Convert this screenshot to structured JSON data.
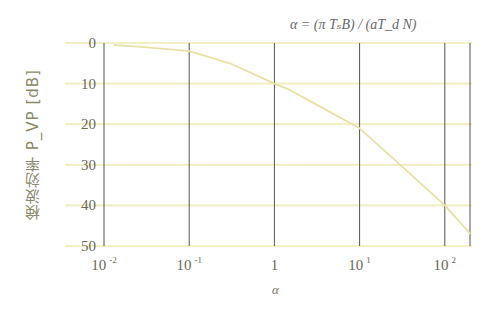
{
  "chart_data": {
    "type": "line",
    "xlabel": "α",
    "ylabel": "検波効率 P_VP [dB]",
    "xscale": "log",
    "xlim": [
      0.01,
      200
    ],
    "ylim": [
      0,
      50
    ],
    "y_inverted": true,
    "grid": true,
    "x_ticks": [
      "10^-2",
      "10^-1",
      "1",
      "10^1",
      "10^2"
    ],
    "y_ticks": [
      "0",
      "10",
      "20",
      "30",
      "40",
      "50"
    ],
    "series": [
      {
        "name": "P_VP",
        "x": [
          0.013,
          0.03,
          0.1,
          0.3,
          1,
          1.5,
          3,
          10,
          30,
          100,
          200
        ],
        "values": [
          0.5,
          1,
          2,
          5,
          10,
          11.5,
          15,
          21,
          30,
          40,
          47
        ]
      }
    ]
  },
  "labels": {
    "title_prefix": "α = (π T",
    "title_full": "α = (π TₛB) / (aT_d N)",
    "xlabel": "α",
    "ylabel": "検波効率 P_VP [dB]",
    "xticks": [
      {
        "base": "10",
        "exp": "-2"
      },
      {
        "base": "10",
        "exp": "-1"
      },
      {
        "base": "1",
        "exp": ""
      },
      {
        "base": "10",
        "exp": "1"
      },
      {
        "base": "10",
        "exp": "2"
      }
    ],
    "yticks": [
      "0",
      "10",
      "20",
      "30",
      "40",
      "50"
    ]
  },
  "colors": {
    "grid_h": "#f3f0c8",
    "grid_v": "#555555",
    "curve": "#e6e2a8",
    "text": "#6a6a5a"
  }
}
